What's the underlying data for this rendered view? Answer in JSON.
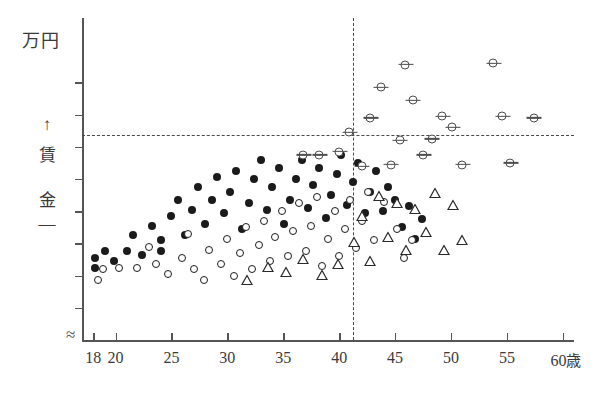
{
  "chart_data": {
    "type": "scatter",
    "title": "",
    "unit_label": "万円",
    "ylabel_chars": [
      "↑",
      "賃",
      "金",
      "—"
    ],
    "ylabel": "賃金",
    "xlabel": "",
    "x_suffix": "歳",
    "xlim": [
      17,
      61
    ],
    "ylim": [
      0,
      10
    ],
    "xticks": [
      18,
      20,
      25,
      30,
      35,
      40,
      45,
      50,
      55,
      60
    ],
    "xticklabels": [
      "18",
      "20",
      "25",
      "30",
      "35",
      "40",
      "45",
      "50",
      "55",
      "60"
    ],
    "yticks": [
      1,
      2,
      3,
      4,
      5,
      6,
      7,
      8
    ],
    "yticklabels": [
      "",
      "",
      "",
      "",
      "",
      "",
      "",
      ""
    ],
    "grid": false,
    "legend": "none",
    "axis_break": true,
    "annotations": {
      "vertical_reference_line": {
        "x": 40,
        "style": "dashed"
      },
      "horizontal_reference_line": {
        "y": 5.4,
        "style": "dashed"
      }
    },
    "series": [
      {
        "name": "filled-circle",
        "marker": "●",
        "points": [
          [
            18.2,
            2.55
          ],
          [
            18.2,
            2.25
          ],
          [
            19.1,
            2.75
          ],
          [
            19.9,
            2.45
          ],
          [
            21.0,
            2.75
          ],
          [
            21.6,
            3.25
          ],
          [
            22.4,
            2.65
          ],
          [
            23.3,
            3.55
          ],
          [
            24.1,
            3.1
          ],
          [
            24.1,
            2.75
          ],
          [
            25.0,
            3.85
          ],
          [
            25.6,
            4.35
          ],
          [
            26.2,
            3.25
          ],
          [
            26.8,
            4.05
          ],
          [
            27.4,
            4.75
          ],
          [
            28.0,
            3.6
          ],
          [
            28.6,
            4.35
          ],
          [
            29.1,
            5.05
          ],
          [
            29.7,
            3.95
          ],
          [
            30.2,
            4.6
          ],
          [
            30.8,
            5.25
          ],
          [
            31.3,
            3.45
          ],
          [
            31.9,
            4.25
          ],
          [
            32.4,
            5.0
          ],
          [
            33.0,
            5.6
          ],
          [
            33.5,
            4.05
          ],
          [
            34.0,
            4.75
          ],
          [
            34.6,
            5.35
          ],
          [
            35.1,
            3.6
          ],
          [
            35.6,
            4.35
          ],
          [
            36.1,
            5.0
          ],
          [
            36.7,
            5.6
          ],
          [
            37.2,
            4.1
          ],
          [
            37.7,
            4.8
          ],
          [
            38.2,
            5.35
          ],
          [
            38.8,
            3.8
          ],
          [
            39.3,
            4.5
          ],
          [
            39.8,
            5.15
          ],
          [
            40.2,
            5.75
          ],
          [
            40.7,
            4.2
          ],
          [
            41.2,
            4.9
          ],
          [
            41.7,
            5.5
          ],
          [
            42.3,
            3.95
          ],
          [
            42.8,
            4.6
          ],
          [
            43.3,
            5.25
          ],
          [
            43.9,
            4.0
          ],
          [
            44.4,
            4.75
          ],
          [
            45.0,
            4.35
          ],
          [
            45.6,
            3.5
          ],
          [
            46.2,
            4.15
          ],
          [
            46.8,
            3.15
          ],
          [
            47.4,
            3.75
          ]
        ]
      },
      {
        "name": "open-circle",
        "marker": "○",
        "points": [
          [
            18.4,
            1.85
          ],
          [
            18.9,
            2.2
          ],
          [
            20.3,
            2.25
          ],
          [
            21.9,
            2.25
          ],
          [
            23.0,
            2.9
          ],
          [
            23.6,
            2.35
          ],
          [
            24.7,
            2.05
          ],
          [
            25.9,
            2.55
          ],
          [
            26.5,
            3.3
          ],
          [
            27.0,
            2.2
          ],
          [
            27.9,
            1.85
          ],
          [
            28.4,
            2.8
          ],
          [
            29.4,
            2.35
          ],
          [
            30.0,
            3.15
          ],
          [
            30.6,
            2.0
          ],
          [
            31.1,
            2.7
          ],
          [
            31.7,
            3.5
          ],
          [
            32.2,
            2.2
          ],
          [
            32.8,
            2.95
          ],
          [
            33.3,
            3.7
          ],
          [
            33.8,
            2.45
          ],
          [
            34.3,
            3.2
          ],
          [
            34.9,
            4.0
          ],
          [
            35.4,
            2.6
          ],
          [
            35.9,
            3.4
          ],
          [
            36.4,
            4.25
          ],
          [
            37.0,
            2.75
          ],
          [
            37.5,
            3.55
          ],
          [
            38.0,
            4.45
          ],
          [
            38.5,
            2.3
          ],
          [
            39.0,
            3.15
          ],
          [
            39.6,
            4.0
          ],
          [
            40.0,
            2.6
          ],
          [
            40.5,
            3.45
          ],
          [
            41.0,
            4.35
          ],
          [
            41.5,
            2.85
          ],
          [
            42.0,
            3.7
          ],
          [
            42.6,
            4.6
          ],
          [
            43.1,
            3.1
          ],
          [
            44.0,
            4.3
          ],
          [
            45.2,
            3.45
          ],
          [
            45.8,
            2.55
          ],
          [
            46.5,
            3.1
          ]
        ]
      },
      {
        "name": "triangle",
        "marker": "△",
        "points": [
          [
            31.8,
            1.95
          ],
          [
            33.6,
            2.35
          ],
          [
            35.2,
            2.2
          ],
          [
            36.8,
            2.6
          ],
          [
            38.5,
            2.1
          ],
          [
            39.9,
            2.45
          ],
          [
            41.3,
            3.15
          ],
          [
            42.0,
            3.95
          ],
          [
            42.8,
            2.55
          ],
          [
            43.6,
            4.55
          ],
          [
            44.4,
            3.3
          ],
          [
            45.2,
            4.35
          ],
          [
            46.0,
            2.9
          ],
          [
            46.8,
            4.15
          ],
          [
            47.8,
            3.45
          ],
          [
            48.6,
            4.65
          ],
          [
            49.4,
            2.9
          ],
          [
            50.2,
            4.3
          ],
          [
            51.0,
            3.2
          ]
        ]
      },
      {
        "name": "crossed-circle",
        "marker": "⊖",
        "points": [
          [
            36.8,
            5.75
          ],
          [
            38.2,
            5.75
          ],
          [
            40.0,
            5.85
          ],
          [
            40.9,
            6.45
          ],
          [
            42.0,
            5.4
          ],
          [
            42.8,
            6.9
          ],
          [
            43.7,
            7.85
          ],
          [
            44.6,
            5.45
          ],
          [
            45.4,
            6.2
          ],
          [
            45.9,
            8.55
          ],
          [
            46.6,
            7.45
          ],
          [
            47.5,
            5.75
          ],
          [
            48.3,
            6.25
          ],
          [
            49.2,
            6.95
          ],
          [
            50.1,
            6.6
          ],
          [
            51.0,
            5.45
          ],
          [
            53.8,
            8.6
          ],
          [
            54.6,
            6.95
          ],
          [
            55.3,
            5.5
          ],
          [
            57.4,
            6.9
          ]
        ]
      }
    ]
  }
}
